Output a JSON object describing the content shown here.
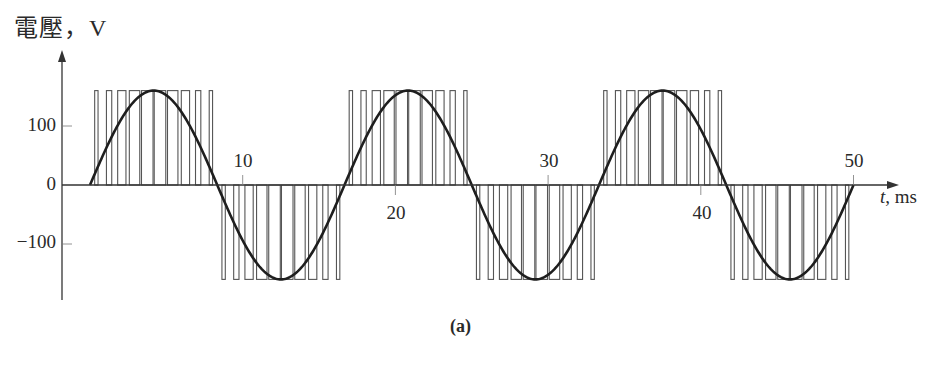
{
  "chart_data": {
    "type": "line",
    "title": "",
    "ylabel": "電壓，V",
    "xlabel_var": "t",
    "xlabel_unit": ", ms",
    "caption": "(a)",
    "x_ticks": [
      10,
      20,
      30,
      40,
      50
    ],
    "x_tick_labels": [
      "10",
      "20",
      "30",
      "40",
      "50"
    ],
    "y_ticks": [
      100,
      0,
      -100
    ],
    "y_tick_labels": [
      "100",
      "0",
      "−100"
    ],
    "xlim": [
      0,
      50
    ],
    "ylim": [
      -160,
      160
    ],
    "grid": false,
    "legend": null,
    "series": [
      {
        "name": "fundamental sine (60 Hz)",
        "style": "thick solid line",
        "amplitude_V": 160,
        "frequency_Hz": 60,
        "period_ms": 16.67,
        "x": [
          0,
          4.17,
          8.33,
          12.5,
          16.67,
          20.83,
          25,
          29.17,
          33.33,
          37.5,
          41.67,
          45.83,
          50
        ],
        "y": [
          0,
          160,
          0,
          -160,
          0,
          160,
          0,
          -160,
          0,
          160,
          0,
          -160,
          0
        ]
      },
      {
        "name": "PWM pulse train (unipolar SPWM)",
        "style": "thin rectangular pulses",
        "pulse_amplitude_V": 160,
        "pulses_per_half_cycle": 10,
        "half_cycles": 6,
        "polarity_sequence": [
          "+",
          "-",
          "+",
          "-",
          "+",
          "-"
        ]
      }
    ]
  }
}
